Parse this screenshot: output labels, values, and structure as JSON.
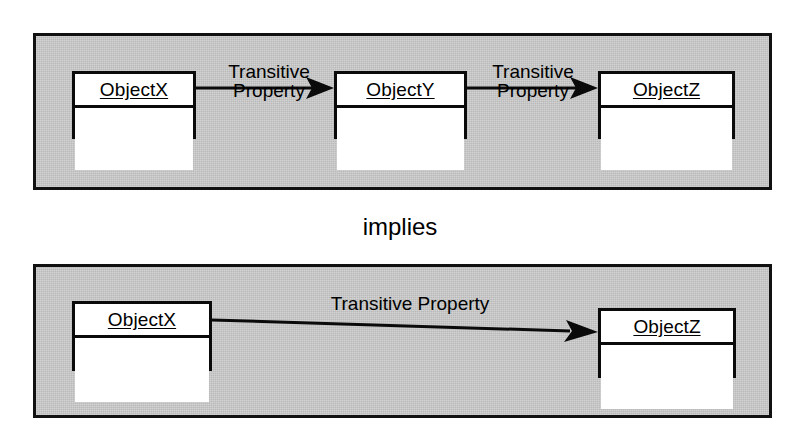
{
  "diagram": {
    "connector_text": "implies",
    "colors": {
      "panel_fill": "#b9b9b9",
      "panel_border": "#111111",
      "box_fill": "#ffffff",
      "box_border": "#0a0a0a",
      "text": "#000000"
    },
    "premise_panel": {
      "name": "premise-panel",
      "boxes": [
        {
          "id": "top-x",
          "name": "ObjectX",
          "compartments": 2
        },
        {
          "id": "top-y",
          "name": "ObjectY",
          "compartments": 2
        },
        {
          "id": "top-z",
          "name": "ObjectZ",
          "compartments": 2
        }
      ],
      "edges": [
        {
          "id": "edge-xy",
          "from": "ObjectX",
          "to": "ObjectY",
          "label_line1": "Transitive",
          "label_line2": "Property",
          "arrow": "filled-solid-arrowhead"
        },
        {
          "id": "edge-yz",
          "from": "ObjectY",
          "to": "ObjectZ",
          "label_line1": "Transitive",
          "label_line2": "Property",
          "arrow": "filled-solid-arrowhead"
        }
      ]
    },
    "conclusion_panel": {
      "name": "conclusion-panel",
      "boxes": [
        {
          "id": "bot-x",
          "name": "ObjectX",
          "compartments": 2
        },
        {
          "id": "bot-z",
          "name": "ObjectZ",
          "compartments": 2
        }
      ],
      "edges": [
        {
          "id": "edge-xz",
          "from": "ObjectX",
          "to": "ObjectZ",
          "label_line1": "Transitive Property",
          "label_line2": "",
          "arrow": "filled-solid-arrowhead"
        }
      ]
    }
  }
}
